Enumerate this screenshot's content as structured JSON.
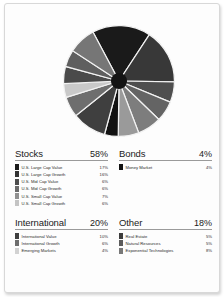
{
  "chart_data": {
    "type": "pie",
    "legend_position": "below",
    "labels": [
      "U.S. Large Cap Value",
      "U.S. Large Cap Growth",
      "U.S. Mid Cap Value",
      "U.S. Mid Cap Growth",
      "U.S. Small Cap Value",
      "U.S. Small Cap Growth",
      "Money Market",
      "International Value",
      "International Growth",
      "Emerging Markets",
      "Real Estate",
      "Natural Resources",
      "Exponential Technologies"
    ],
    "values": [
      17,
      16,
      6,
      6,
      7,
      6,
      4,
      10,
      6,
      4,
      5,
      5,
      8
    ],
    "colors": [
      "#1a1a1a",
      "#383838",
      "#4f4f4f",
      "#646464",
      "#7d7d7d",
      "#9a9a9a",
      "#121212",
      "#3f3f3f",
      "#6e6e6e",
      "#c9c9c9",
      "#4a4a4a",
      "#5f5f5f",
      "#767676"
    ],
    "units": "percent",
    "total": 100
  },
  "panels": [
    {
      "title": "Stocks",
      "total": "58%",
      "items": [
        {
          "label": "U.S. Large Cap Value",
          "value": "17%",
          "color": "#1a1a1a"
        },
        {
          "label": "U.S. Large Cap Growth",
          "value": "16%",
          "color": "#333333"
        },
        {
          "label": "U.S. Mid Cap Value",
          "value": "6%",
          "color": "#4d4d4d"
        },
        {
          "label": "U.S. Mid Cap Growth",
          "value": "6%",
          "color": "#6b6b6b"
        },
        {
          "label": "U.S. Small Cap Value",
          "value": "7%",
          "color": "#919191"
        },
        {
          "label": "U.S. Small Cap Growth",
          "value": "6%",
          "color": "#c4c4c4"
        }
      ]
    },
    {
      "title": "Bonds",
      "total": "4%",
      "items": [
        {
          "label": "Money Market",
          "value": "4%",
          "color": "#121212"
        }
      ]
    },
    {
      "title": "International",
      "total": "20%",
      "items": [
        {
          "label": "International Value",
          "value": "10%",
          "color": "#3f3f3f"
        },
        {
          "label": "International Growth",
          "value": "6%",
          "color": "#6e6e6e"
        },
        {
          "label": "Emerging Markets",
          "value": "4%",
          "color": "#d2d2d2"
        }
      ]
    },
    {
      "title": "Other",
      "total": "18%",
      "items": [
        {
          "label": "Real Estate",
          "value": "5%",
          "color": "#3c3c3c"
        },
        {
          "label": "Natural Resources",
          "value": "5%",
          "color": "#5c5c5c"
        },
        {
          "label": "Exponential Technologies",
          "value": "8%",
          "color": "#787878"
        }
      ]
    }
  ]
}
